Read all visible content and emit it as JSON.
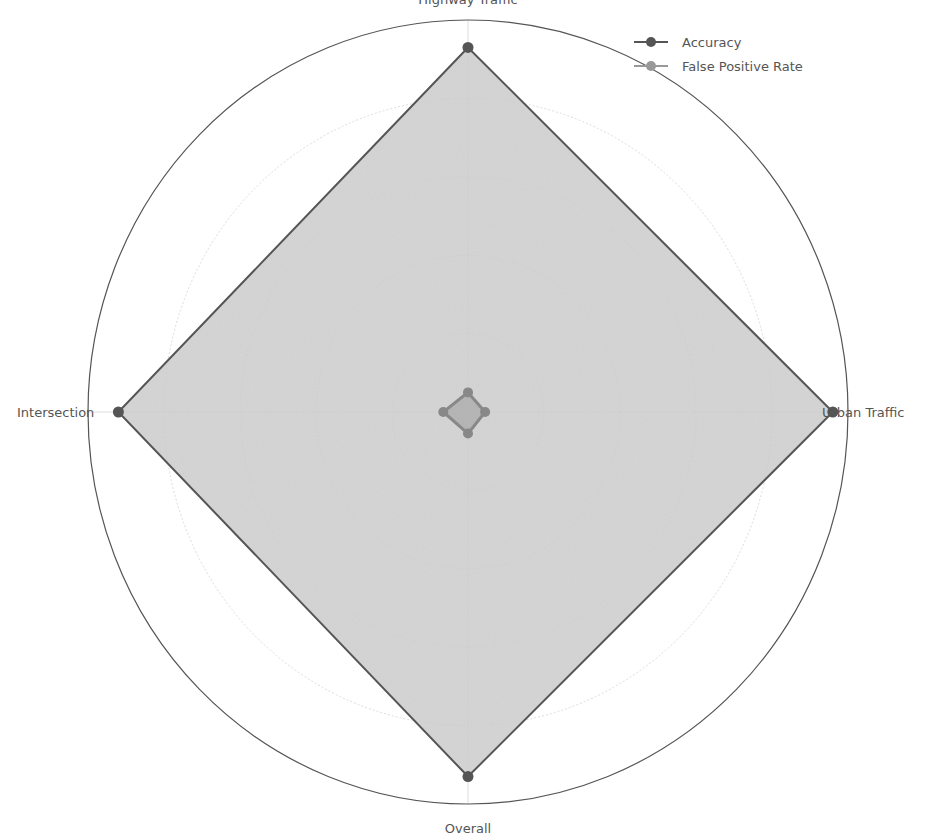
{
  "chart_data": {
    "type": "radar",
    "title": "",
    "categories": [
      "Highway Traffic",
      "Urban Traffic",
      "Overall",
      "Intersection"
    ],
    "series": [
      {
        "name": "Accuracy",
        "values": [
          0.93,
          0.96,
          0.93,
          0.92
        ],
        "color": "#555555",
        "fill": "#cccccc"
      },
      {
        "name": "False Positive Rate",
        "values": [
          0.05,
          0.045,
          0.055,
          0.065
        ],
        "color": "#888888",
        "fill": "#b0b0b0"
      }
    ],
    "rlim": [
      0,
      1.0
    ],
    "grid_rings": [
      0.2,
      0.4,
      0.6,
      0.8,
      1.0
    ],
    "grid": true,
    "legend_position": "upper right",
    "rtick_labels_visible": false
  },
  "labels": {
    "top": "Highway Traffic",
    "right": "Urban Traffic",
    "bottom": "Overall",
    "left": "Intersection"
  },
  "legend": {
    "items": [
      {
        "label": "Accuracy",
        "color": "#555555"
      },
      {
        "label": "False Positive Rate",
        "color": "#999999"
      }
    ]
  }
}
